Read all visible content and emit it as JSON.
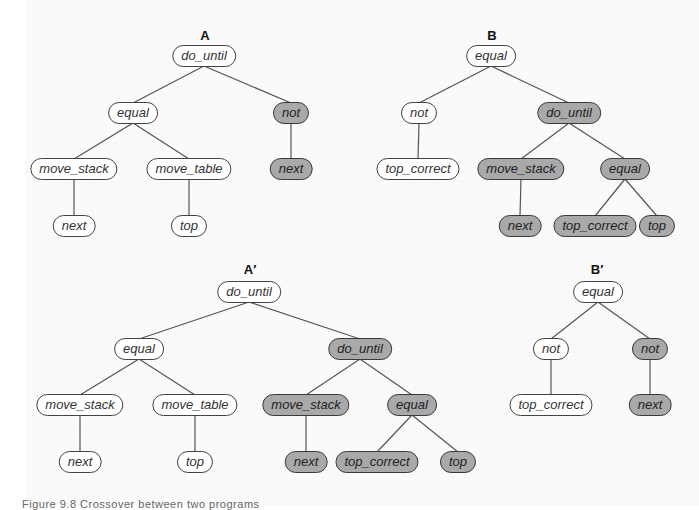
{
  "colors": {
    "node_fill": "#ffffff",
    "node_shaded_fill": "#a9a9a9",
    "node_border": "#444444",
    "edge": "#555555",
    "background": "#fafafa"
  },
  "caption": "Figure 9.8   Crossover between two programs",
  "trees": [
    {
      "label": "A",
      "label_pos": [
        205,
        35
      ],
      "nodes": [
        {
          "id": "a1",
          "text": "do_until",
          "x": 204,
          "y": 56,
          "shaded": false
        },
        {
          "id": "a2",
          "text": "equal",
          "x": 133,
          "y": 113,
          "shaded": false,
          "parent": "a1"
        },
        {
          "id": "a3",
          "text": "not",
          "x": 291,
          "y": 113,
          "shaded": true,
          "parent": "a1"
        },
        {
          "id": "a4",
          "text": "move_stack",
          "x": 74,
          "y": 169,
          "shaded": false,
          "parent": "a2"
        },
        {
          "id": "a5",
          "text": "move_table",
          "x": 189,
          "y": 169,
          "shaded": false,
          "parent": "a2"
        },
        {
          "id": "a6",
          "text": "next",
          "x": 291,
          "y": 169,
          "shaded": true,
          "parent": "a3"
        },
        {
          "id": "a7",
          "text": "next",
          "x": 74,
          "y": 226,
          "shaded": false,
          "parent": "a4"
        },
        {
          "id": "a8",
          "text": "top",
          "x": 189,
          "y": 226,
          "shaded": false,
          "parent": "a5"
        }
      ]
    },
    {
      "label": "B",
      "label_pos": [
        492,
        35
      ],
      "nodes": [
        {
          "id": "b1",
          "text": "equal",
          "x": 491,
          "y": 56,
          "shaded": false
        },
        {
          "id": "b2",
          "text": "not",
          "x": 419,
          "y": 113,
          "shaded": false,
          "parent": "b1"
        },
        {
          "id": "b3",
          "text": "do_until",
          "x": 569,
          "y": 113,
          "shaded": true,
          "parent": "b1"
        },
        {
          "id": "b4",
          "text": "top_correct",
          "x": 418,
          "y": 169,
          "shaded": false,
          "parent": "b2"
        },
        {
          "id": "b5",
          "text": "move_stack",
          "x": 521,
          "y": 169,
          "shaded": true,
          "parent": "b3"
        },
        {
          "id": "b6",
          "text": "equal",
          "x": 625,
          "y": 169,
          "shaded": true,
          "parent": "b3"
        },
        {
          "id": "b7",
          "text": "next",
          "x": 520,
          "y": 226,
          "shaded": true,
          "parent": "b5"
        },
        {
          "id": "b8",
          "text": "top_correct",
          "x": 595,
          "y": 226,
          "shaded": true,
          "parent": "b6"
        },
        {
          "id": "b9",
          "text": "top",
          "x": 657,
          "y": 226,
          "shaded": true,
          "parent": "b6"
        }
      ]
    },
    {
      "label": "A′",
      "label_pos": [
        250,
        269
      ],
      "nodes": [
        {
          "id": "c1",
          "text": "do_until",
          "x": 249,
          "y": 292,
          "shaded": false
        },
        {
          "id": "c2",
          "text": "equal",
          "x": 139,
          "y": 349,
          "shaded": false,
          "parent": "c1"
        },
        {
          "id": "c3",
          "text": "do_until",
          "x": 360,
          "y": 349,
          "shaded": true,
          "parent": "c1"
        },
        {
          "id": "c4",
          "text": "move_stack",
          "x": 80,
          "y": 405,
          "shaded": false,
          "parent": "c2"
        },
        {
          "id": "c5",
          "text": "move_table",
          "x": 195,
          "y": 405,
          "shaded": false,
          "parent": "c2"
        },
        {
          "id": "c6",
          "text": "move_stack",
          "x": 306,
          "y": 405,
          "shaded": true,
          "parent": "c3"
        },
        {
          "id": "c7",
          "text": "equal",
          "x": 412,
          "y": 405,
          "shaded": true,
          "parent": "c3"
        },
        {
          "id": "c8",
          "text": "next",
          "x": 80,
          "y": 462,
          "shaded": false,
          "parent": "c4"
        },
        {
          "id": "c9",
          "text": "top",
          "x": 195,
          "y": 462,
          "shaded": false,
          "parent": "c5"
        },
        {
          "id": "c10",
          "text": "next",
          "x": 306,
          "y": 462,
          "shaded": true,
          "parent": "c6"
        },
        {
          "id": "c11",
          "text": "top_correct",
          "x": 377,
          "y": 462,
          "shaded": true,
          "parent": "c7"
        },
        {
          "id": "c12",
          "text": "top",
          "x": 458,
          "y": 462,
          "shaded": true,
          "parent": "c7"
        }
      ]
    },
    {
      "label": "B′",
      "label_pos": [
        597,
        269
      ],
      "nodes": [
        {
          "id": "d1",
          "text": "equal",
          "x": 598,
          "y": 292,
          "shaded": false
        },
        {
          "id": "d2",
          "text": "not",
          "x": 551,
          "y": 349,
          "shaded": false,
          "parent": "d1"
        },
        {
          "id": "d3",
          "text": "not",
          "x": 650,
          "y": 349,
          "shaded": true,
          "parent": "d1"
        },
        {
          "id": "d4",
          "text": "top_correct",
          "x": 551,
          "y": 405,
          "shaded": false,
          "parent": "d2"
        },
        {
          "id": "d5",
          "text": "next",
          "x": 650,
          "y": 405,
          "shaded": true,
          "parent": "d3"
        }
      ]
    }
  ]
}
